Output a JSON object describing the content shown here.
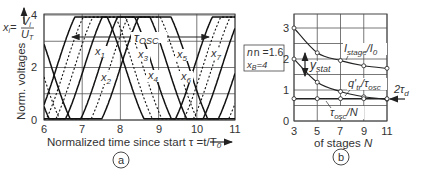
{
  "chart_data": [
    {
      "panel": "a",
      "type": "line",
      "title": "",
      "xlabel": "Normalized time since start τ = t/T0",
      "ylabel": "Norm. voltages  x_i = V_i / U_T",
      "xlim": [
        6,
        11
      ],
      "ylim": [
        0,
        4
      ],
      "xticks": [
        "6",
        "7",
        "8",
        "9",
        "10",
        "11"
      ],
      "yticks": [
        "0",
        "2",
        "4"
      ],
      "grid": true,
      "series": [
        {
          "name": "x1",
          "style": "solid",
          "phase": 7.23
        },
        {
          "name": "x2",
          "style": "dashed",
          "phase": 7.45
        },
        {
          "name": "x3",
          "style": "dashed",
          "phase": 7.7
        },
        {
          "name": "x4",
          "style": "solid",
          "phase": 7.95
        },
        {
          "name": "x5",
          "style": "solid",
          "phase": 8.35
        },
        {
          "name": "x6",
          "style": "dashed",
          "phase": 8.62
        },
        {
          "name": "x7",
          "style": "solid",
          "phase": 8.9
        }
      ],
      "period": 3.6,
      "annotations": [
        {
          "text": "τ_osc",
          "kind": "double-arrow",
          "from": 6.95,
          "to": 10.35,
          "y": 3.15
        },
        {
          "text": "n = 1.6",
          "kind": "box"
        },
        {
          "text": "x_B = 4",
          "kind": "box"
        }
      ],
      "series_labels": [
        "x1",
        "x2",
        "x3",
        "x4",
        "x5",
        "x6",
        "x7"
      ]
    },
    {
      "panel": "b",
      "type": "line",
      "xlabel": "of stages N",
      "ylabel": "",
      "xlim": [
        3,
        11
      ],
      "ylim": [
        0,
        3
      ],
      "xticks": [
        "3",
        "5",
        "7",
        "9",
        "11"
      ],
      "yticks": [
        "0",
        "1",
        "2",
        "3"
      ],
      "grid": true,
      "x": [
        3,
        5,
        7,
        9,
        11
      ],
      "series": [
        {
          "name": "I_stage/I0",
          "values": [
            3.0,
            2.2,
            1.95,
            1.78,
            1.7
          ]
        },
        {
          "name": "q'_tr/τ_osc",
          "values": [
            2.0,
            1.25,
            0.95,
            0.78,
            0.7
          ]
        },
        {
          "name": "τ_osc/N",
          "values": [
            0.72,
            0.72,
            0.72,
            0.72,
            0.72
          ]
        }
      ],
      "annotations": [
        {
          "text": "y_stat",
          "kind": "double-arrow",
          "x": 5,
          "from": 2.2,
          "to": 1.25
        },
        {
          "text": "2τ_d",
          "kind": "arrow",
          "x": 11,
          "y": 0.72
        }
      ]
    }
  ],
  "panel_a": {
    "y_axis_title": "Norm. voltages",
    "y_axis_formula_x": "x",
    "y_axis_formula_i": "i",
    "y_axis_formula_eq": "=",
    "y_axis_formula_num": "V",
    "y_axis_formula_num_sub": "i",
    "y_axis_formula_den": "U",
    "y_axis_formula_den_sub": "T",
    "x_axis_title": "Normalized time since start τ =t/T",
    "x_axis_title_sub": "0",
    "ticks_x": [
      "6",
      "7",
      "8",
      "9",
      "10",
      "11"
    ],
    "ticks_y": [
      "4",
      "2",
      "0"
    ],
    "tau_osc": "τ",
    "tau_osc_sub": "OSC",
    "box_n": "n =1.6",
    "box_xb": "x",
    "box_xb_sub": "B",
    "box_xb_val": "=4",
    "series_labels": [
      "x",
      "x",
      "x",
      "x",
      "x",
      "x",
      "x"
    ],
    "series_subs": [
      "1",
      "2",
      "3",
      "4",
      "5",
      "6",
      "7"
    ],
    "badge": "a"
  },
  "panel_b": {
    "x_axis_title": "of stages ",
    "x_axis_var": "N",
    "ticks_x": [
      "3",
      "5",
      "7",
      "9",
      "11"
    ],
    "ticks_y": [
      "3",
      "2",
      "1",
      "0"
    ],
    "label_istage": "I",
    "label_istage_sub": "stage",
    "label_istage_den": "/I",
    "label_istage_den_sub": "0",
    "label_ystat": "y",
    "label_ystat_sub": "stat",
    "label_qtr": "q'",
    "label_qtr_sub": "tr",
    "label_qtr_den": "/τ",
    "label_qtr_den_sub": "osc",
    "label_tauN": "τ",
    "label_tauN_sub": "osc",
    "label_tauN_den": "/N",
    "label_2td": "2τ",
    "label_2td_sub": "d",
    "badge": "b"
  }
}
